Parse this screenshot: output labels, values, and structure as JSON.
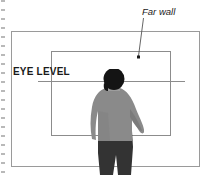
{
  "figure": {
    "background_color": "#ffffff"
  },
  "annotations": {
    "far_wall_label": "Far wall",
    "eye_level_label": "EYE LEVEL"
  },
  "elements": {
    "binding_dots_name": "binding-holes-dotted-margin",
    "outer_frame_name": "room-outer-frame",
    "far_wall_rect_name": "far-wall-rectangle",
    "eye_level_line_name": "eye-level-horizontal-line",
    "leader_line_name": "far-wall-leader-line",
    "person_name": "person-silhouette-back-view"
  },
  "colors": {
    "frame_line": "#9a9a9a",
    "inner_line": "#8c8c8c",
    "eye_level_line": "#8c8c8c",
    "dots": "#b9b9b9",
    "text": "#1a1a1a",
    "hair": "#141414",
    "sweater": "#8a8a8a",
    "sweater_shadow": "#6f6f6f",
    "pants": "#333333",
    "skin": "#b5b5b5"
  },
  "geometry": {
    "outer_frame": {
      "x": 11,
      "y": 31,
      "width": 189,
      "height": 136
    },
    "far_wall_rect": {
      "x": 51,
      "y": 51,
      "width": 120,
      "height": 85
    },
    "eye_level_line": {
      "x1": 38,
      "y1": 81,
      "x2": 185,
      "y2": 81
    },
    "leader_line": {
      "x1": 143,
      "y1": 18,
      "x2": 138,
      "y2": 56
    },
    "leader_dot": {
      "x": 138,
      "y": 57
    }
  }
}
